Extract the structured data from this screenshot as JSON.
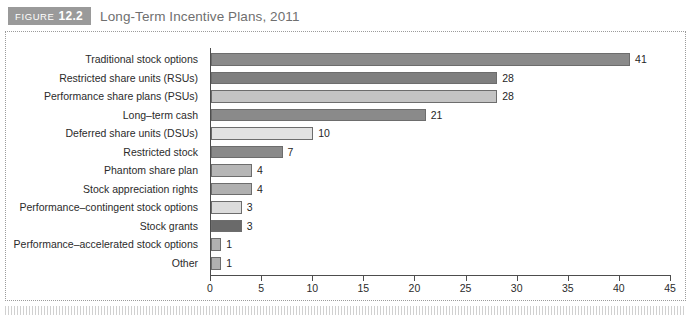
{
  "header": {
    "badge_word": "FIGURE",
    "badge_number": "12.2",
    "title": "Long-Term Incentive Plans, 2011"
  },
  "chart_data": {
    "type": "bar",
    "orientation": "horizontal",
    "title": "Long-Term Incentive Plans, 2011",
    "xlabel": "",
    "ylabel": "",
    "xlim": [
      0,
      45
    ],
    "xticks": [
      "0",
      "5",
      "10",
      "15",
      "20",
      "25",
      "30",
      "35",
      "40",
      "45"
    ],
    "grid": false,
    "legend": "none",
    "categories": [
      "Traditional stock options",
      "Restricted share units (RSUs)",
      "Performance share plans (PSUs)",
      "Long–term cash",
      "Deferred share units (DSUs)",
      "Restricted stock",
      "Phantom share plan",
      "Stock appreciation rights",
      "Performance–contingent stock options",
      "Stock grants",
      "Performance–accelerated stock options",
      "Other"
    ],
    "values": [
      41,
      28,
      28,
      21,
      10,
      7,
      4,
      4,
      3,
      3,
      1,
      1
    ],
    "value_labels": [
      "41",
      "28",
      "28",
      "21",
      "10",
      "7",
      "4",
      "4",
      "3",
      "3",
      "1",
      "1"
    ],
    "bar_colors": [
      "#8a8a8a",
      "#7f7f7f",
      "#c4c4c4",
      "#8a8a8a",
      "#e2e2e2",
      "#8a8a8a",
      "#b6b6b6",
      "#b0b0b0",
      "#dcdcdc",
      "#6a6a6a",
      "#b0b0b0",
      "#b0b0b0"
    ]
  },
  "colors": {
    "badge_bg": "#9a9a9a",
    "title_text": "#6f6f6f",
    "axis": "#4d4d4d",
    "frame_border": "#9b9b9b",
    "bar_outline": "#6d6d6d"
  }
}
